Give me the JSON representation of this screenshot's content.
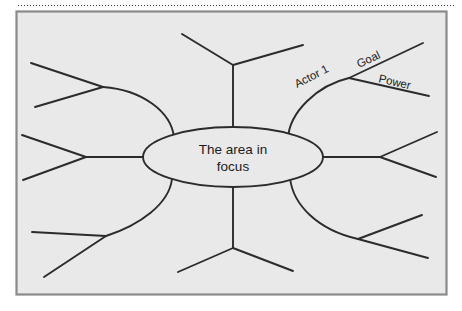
{
  "figure": {
    "type": "mind-map",
    "title_text": "",
    "frame": {
      "fill_color": "#e9e9e9",
      "border_color": "#8a8a8a",
      "x": 16,
      "y": 11,
      "width": 431,
      "height": 284
    },
    "top_rule": {
      "style": "dotted",
      "color": "#3a3a3a"
    },
    "stroke_color": "#2b2b2b",
    "center_node": {
      "label_line_1": "The area in",
      "label_line_2": "focus",
      "shape": "ellipse",
      "cx": 233,
      "cy": 157,
      "rx": 90,
      "ry": 30,
      "fill_color": "#e9e9e9"
    },
    "branches": [
      {
        "id": "branch-top",
        "direction": "top",
        "shape": "straight",
        "label": "",
        "fork_labels": [
          "",
          ""
        ]
      },
      {
        "id": "branch-top-right",
        "direction": "top-right",
        "shape": "curved",
        "label": "Actor 1",
        "fork_labels": [
          "Goal",
          "Power"
        ]
      },
      {
        "id": "branch-right",
        "direction": "right",
        "shape": "straight",
        "label": "",
        "fork_labels": [
          "",
          ""
        ]
      },
      {
        "id": "branch-bottom-right",
        "direction": "bottom-right",
        "shape": "curved",
        "label": "",
        "fork_labels": [
          "",
          ""
        ]
      },
      {
        "id": "branch-bottom",
        "direction": "bottom",
        "shape": "straight",
        "label": "",
        "fork_labels": [
          "",
          ""
        ]
      },
      {
        "id": "branch-bottom-left",
        "direction": "bottom-left",
        "shape": "curved",
        "label": "",
        "fork_labels": [
          "",
          ""
        ]
      },
      {
        "id": "branch-left",
        "direction": "left",
        "shape": "straight",
        "label": "",
        "fork_labels": [
          "",
          ""
        ]
      },
      {
        "id": "branch-top-left",
        "direction": "top-left",
        "shape": "curved",
        "label": "",
        "fork_labels": [
          "",
          ""
        ]
      }
    ],
    "labels": {
      "actor_1": "Actor 1",
      "goal": "Goal",
      "power": "Power"
    }
  }
}
